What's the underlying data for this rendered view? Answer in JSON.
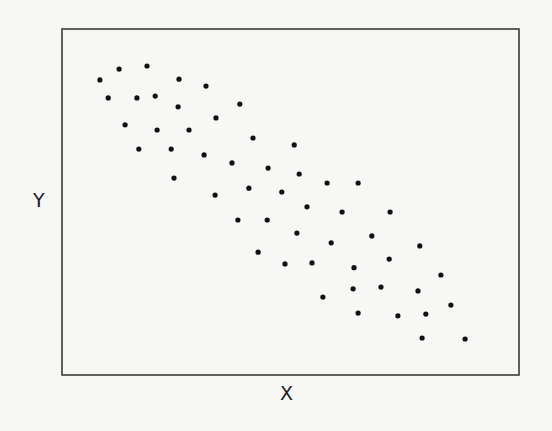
{
  "chart_data": {
    "type": "scatter",
    "title": "",
    "xlabel": "X",
    "ylabel": "Y",
    "xlim": [
      0,
      100
    ],
    "ylim": [
      0,
      100
    ],
    "grid": false,
    "legend": null,
    "ticks": "none",
    "annotation": "Unlabeled axes; coordinates normalized to 0-100 of plot frame. Shows a negative correlation.",
    "marker_color": "#111111",
    "frame_color": "#3a3a3a",
    "series": [
      {
        "name": "points",
        "x": [
          8.3,
          12.5,
          18.6,
          25.6,
          31.5,
          10.1,
          16.4,
          20.4,
          25.4,
          33.7,
          38.9,
          13.8,
          20.8,
          27.8,
          41.8,
          16.8,
          23.9,
          31.1,
          50.8,
          37.2,
          45.1,
          51.9,
          24.5,
          40.9,
          48.1,
          58.0,
          64.8,
          33.5,
          53.6,
          61.3,
          71.8,
          38.5,
          44.9,
          51.4,
          67.8,
          58.9,
          78.3,
          42.9,
          71.6,
          48.8,
          54.7,
          63.9,
          82.9,
          63.7,
          69.8,
          77.9,
          57.1,
          85.1,
          64.8,
          73.5,
          79.6,
          78.8,
          88.2
        ],
        "y": [
          85.3,
          88.4,
          89.3,
          85.5,
          83.5,
          80.1,
          80.1,
          80.6,
          77.5,
          74.3,
          78.3,
          72.3,
          70.8,
          70.8,
          68.5,
          65.3,
          65.3,
          63.6,
          66.5,
          61.3,
          59.8,
          58.1,
          56.9,
          54.0,
          52.9,
          55.5,
          55.5,
          52.0,
          48.6,
          47.1,
          47.1,
          44.8,
          44.8,
          41.0,
          40.2,
          38.2,
          37.3,
          35.5,
          33.5,
          32.1,
          32.4,
          31.0,
          28.9,
          24.9,
          25.4,
          24.3,
          22.5,
          20.2,
          17.9,
          17.1,
          17.6,
          10.7,
          10.4
        ]
      }
    ]
  },
  "labels": {
    "x": "X",
    "y": "Y"
  }
}
